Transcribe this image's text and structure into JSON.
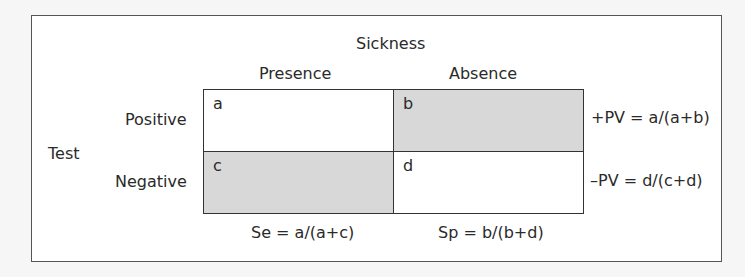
{
  "header": {
    "column_group": "Sickness",
    "columns": [
      "Presence",
      "Absence"
    ],
    "row_group": "Test",
    "rows": [
      "Positive",
      "Negative"
    ]
  },
  "cells": {
    "a": "a",
    "b": "b",
    "c": "c",
    "d": "d"
  },
  "formulas": {
    "ppv": "+PV = a/(a+b)",
    "npv": "–PV = d/(c+d)",
    "sensitivity": "Se = a/(a+c)",
    "specificity": "Sp = b/(b+d)"
  },
  "colors": {
    "shaded_cell": "#d8d8d8",
    "white_cell": "#ffffff",
    "border": "#333333"
  }
}
